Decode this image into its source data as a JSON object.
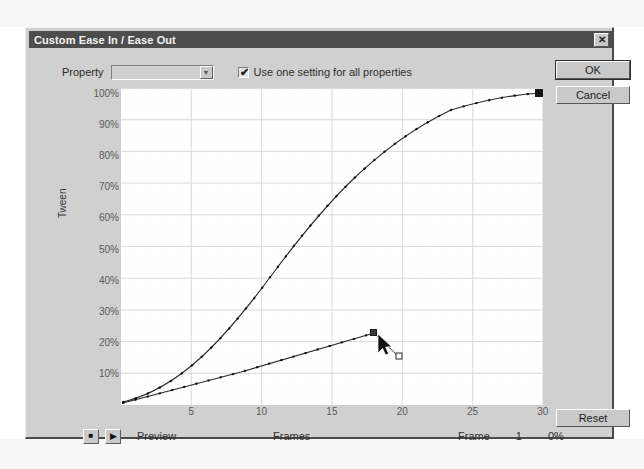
{
  "window": {
    "title": "Custom Ease In / Ease Out",
    "close_icon": "close-icon",
    "close_glyph": "✕"
  },
  "toolbar": {
    "property_label": "Property",
    "property_value": "",
    "property_placeholder": "",
    "chevron_icon": "chevron-down-icon",
    "chevron_glyph": "▼",
    "use_one_setting_label": "Use one setting for all properties",
    "use_one_setting_checked": true,
    "check_glyph": "✔"
  },
  "buttons": {
    "ok": "OK",
    "cancel": "Cancel",
    "reset": "Reset"
  },
  "graph": {
    "y_axis_title": "Tween",
    "x_axis_title": "Frames",
    "y_ticks": [
      "100%",
      "90%",
      "80%",
      "70%",
      "60%",
      "50%",
      "40%",
      "30%",
      "20%",
      "10%"
    ],
    "x_ticks": [
      "5",
      "10",
      "15",
      "20",
      "25",
      "30"
    ]
  },
  "transport": {
    "stop_icon": "stop-icon",
    "stop_glyph": "■",
    "play_icon": "play-icon",
    "play_glyph": "▶",
    "preview_label": "Preview"
  },
  "status": {
    "frame_label": "Frame",
    "frame_value": "1",
    "percent_value": "0%"
  },
  "colors": {
    "dialog_face": "#d0d0d0",
    "titlebar": "#4d4d4d",
    "plot_bg": "#ffffff",
    "gridline": "#d8d8d8",
    "curve": "#2a2a2a"
  },
  "chart_data": {
    "type": "line",
    "title": "Custom Ease In / Ease Out",
    "xlabel": "Frames",
    "ylabel": "Tween",
    "xlim": [
      0,
      31
    ],
    "ylim": [
      0,
      105
    ],
    "grid": true,
    "legend": "none",
    "x_ticks": [
      5,
      10,
      15,
      20,
      25,
      30
    ],
    "y_ticks": [
      10,
      20,
      30,
      40,
      50,
      60,
      70,
      80,
      90,
      100
    ],
    "series": [
      {
        "name": "ease-curve",
        "style": "s-curve",
        "x": [
          0,
          2,
          4,
          6,
          8,
          10,
          12,
          14,
          16,
          18,
          20,
          22,
          24,
          26,
          28,
          30
        ],
        "y": [
          0,
          4,
          9,
          15,
          22,
          30,
          39,
          48,
          57,
          66,
          74,
          81,
          87,
          92,
          96,
          100
        ],
        "end_marker": "filled-square",
        "markers": "dotted-ticks"
      },
      {
        "name": "handle-line",
        "style": "straight",
        "x": [
          0,
          5,
          10,
          15,
          18
        ],
        "y": [
          0,
          7,
          13,
          19,
          23
        ],
        "end_marker": "selected-point",
        "markers": "dotted-ticks"
      }
    ],
    "control_point": {
      "x": 18,
      "y": 23,
      "selected": true
    },
    "tangent_handle": {
      "x": 19.3,
      "y": 17
    },
    "cursor": {
      "x": 19,
      "y": 19,
      "type": "arrow-pointer"
    }
  }
}
